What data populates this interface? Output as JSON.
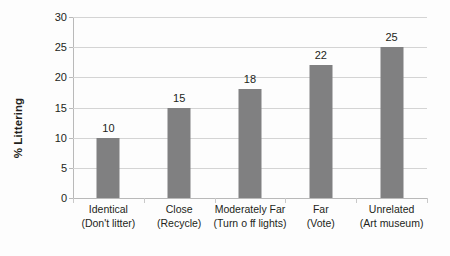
{
  "chart_data": {
    "type": "bar",
    "title": "",
    "xlabel": "",
    "ylabel": "% Littering",
    "ylim": [
      0,
      30
    ],
    "ytick_step": 5,
    "yticks": [
      0,
      5,
      10,
      15,
      20,
      25,
      30
    ],
    "grid": true,
    "legend": false,
    "bar_color": "#808081",
    "gridline_color": "#d4d4d4",
    "axis_color": "#b9b9b9",
    "value_labels_shown": true,
    "categories": [
      "Identical (Don't litter)",
      "Close (Recycle)",
      "Moderately Far (Turn o ff lights)",
      "Far (Vote)",
      "Unrelated (Art museum)"
    ],
    "category_lines": [
      {
        "line1": "Identical",
        "line2": "(Don't litter)"
      },
      {
        "line1": "Close",
        "line2": "(Recycle)"
      },
      {
        "line1": "Moderately Far",
        "line2": "(Turn o ff lights)"
      },
      {
        "line1": "Far",
        "line2": "(Vote)"
      },
      {
        "line1": "Unrelated",
        "line2": "(Art museum)"
      }
    ],
    "values": [
      10,
      15,
      18,
      22,
      25
    ]
  }
}
